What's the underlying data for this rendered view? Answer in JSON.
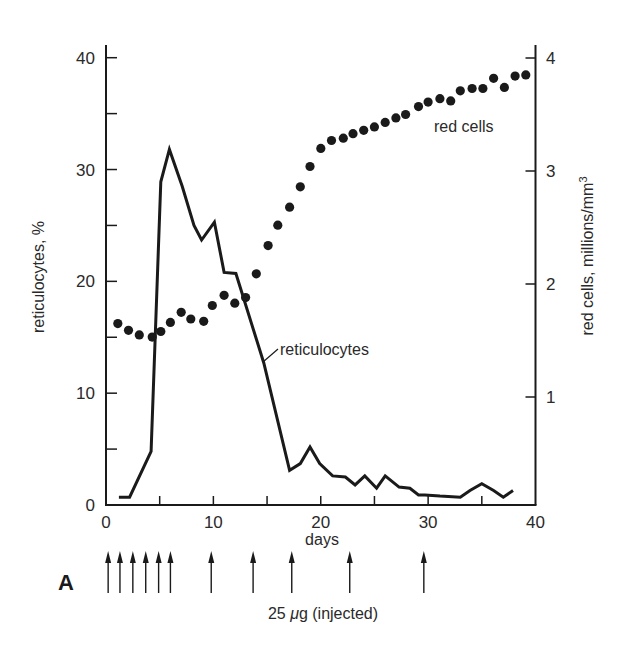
{
  "chart_data": {
    "type": "line",
    "panel_label": "A",
    "title": "",
    "xlabel": "days",
    "ylabel_left": "reticulocytes, %",
    "ylabel_right": "red cells, millions/mm³",
    "xlim": [
      0,
      40
    ],
    "ylim_left": [
      0,
      40
    ],
    "ylim_right": [
      0,
      4
    ],
    "x_ticks": [
      0,
      10,
      20,
      30,
      40
    ],
    "x_minor_ticks": [
      5,
      15,
      25,
      35
    ],
    "y_left_ticks": [
      0,
      10,
      20,
      30,
      40
    ],
    "y_left_minor_ticks": [
      5,
      15,
      25,
      35
    ],
    "y_right_ticks": [
      1,
      2,
      3,
      4
    ],
    "grid": false,
    "legend": "inline annotations",
    "series": [
      {
        "name": "reticulocytes",
        "axis": "left",
        "style": "line",
        "x": [
          1.2,
          2.2,
          4.2,
          5.1,
          5.9,
          7.1,
          8.2,
          8.9,
          10.1,
          11.0,
          12.1,
          14.7,
          17.1,
          18.1,
          19.0,
          19.9,
          21.1,
          22.3,
          23.2,
          24.1,
          25.2,
          26.0,
          27.3,
          28.3,
          29.1,
          29.7,
          31.1,
          33.0,
          33.9,
          35.0,
          36.1,
          37.0,
          37.9
        ],
        "values": [
          0.7,
          0.7,
          4.8,
          28.9,
          31.8,
          28.5,
          25.0,
          23.7,
          25.3,
          20.8,
          20.7,
          12.7,
          3.1,
          3.7,
          5.2,
          3.7,
          2.6,
          2.5,
          1.8,
          2.6,
          1.5,
          2.6,
          1.6,
          1.5,
          0.9,
          0.9,
          0.8,
          0.7,
          1.3,
          1.9,
          1.3,
          0.7,
          1.3
        ]
      },
      {
        "name": "red cells",
        "axis": "right",
        "style": "scatter",
        "x": [
          1.1,
          2.1,
          3.1,
          4.3,
          5.1,
          6.0,
          7.0,
          7.9,
          9.1,
          9.9,
          11.0,
          12.0,
          13.0,
          14.0,
          15.1,
          16.0,
          17.1,
          18.1,
          19.0,
          20.0,
          21.0,
          22.1,
          23.0,
          24.0,
          25.0,
          26.0,
          27.0,
          27.9,
          29.1,
          30.0,
          31.1,
          32.1,
          33.0,
          34.1,
          35.1,
          36.1,
          37.1,
          38.1,
          39.1
        ],
        "values": [
          1.65,
          1.59,
          1.55,
          1.53,
          1.58,
          1.66,
          1.75,
          1.69,
          1.67,
          1.81,
          1.9,
          1.83,
          1.88,
          2.09,
          2.34,
          2.52,
          2.68,
          2.86,
          3.04,
          3.2,
          3.27,
          3.29,
          3.33,
          3.36,
          3.39,
          3.43,
          3.47,
          3.5,
          3.57,
          3.61,
          3.64,
          3.62,
          3.71,
          3.73,
          3.73,
          3.82,
          3.74,
          3.84,
          3.85
        ]
      }
    ],
    "injections": {
      "label": "25 μg (injected)",
      "days": [
        0.2,
        1.3,
        2.5,
        3.7,
        4.9,
        6.0,
        9.8,
        13.7,
        17.3,
        22.7,
        29.6
      ]
    },
    "annotations": [
      {
        "text": "red cells",
        "x": 30.8,
        "y_right": 3.35
      },
      {
        "text": "reticulocytes",
        "x": 16.2,
        "y_left": 13.5
      }
    ]
  },
  "labels": {
    "x_tick_labels": [
      "0",
      "10",
      "20",
      "30",
      "40"
    ],
    "y_left_tick_labels": [
      "0",
      "10",
      "20",
      "30",
      "40"
    ],
    "y_right_tick_labels": [
      "1",
      "2",
      "3",
      "4"
    ],
    "days": "days",
    "left_axis_title": "reticulocytes, %",
    "right_axis_title": "red cells, millions/mm",
    "right_axis_superscript": "3",
    "red_cells_annotation": "red cells",
    "reticulocytes_annotation": "reticulocytes",
    "injection_label_prefix": "25 ",
    "injection_label_mu": "μ",
    "injection_label_suffix": "g (injected)",
    "panel_letter": "A"
  },
  "colors": {
    "ink": "#1a1a1a",
    "text": "#2a2a2a",
    "background": "#ffffff"
  }
}
